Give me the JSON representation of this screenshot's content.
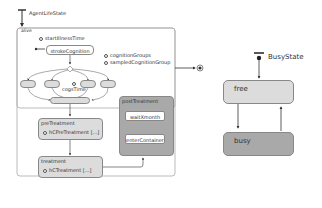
{
  "left_chart": {
    "entry_label": "AgentLifeState",
    "container_label": "alive",
    "events": [
      "startIllnessTime",
      "cognitionGroups",
      "sampledCognitionGroup",
      "cogsTime"
    ],
    "states": {
      "stroke": "strokeCognition",
      "preTreatment": {
        "title": "preTreatment",
        "action": "hCPreTreatment [...]"
      },
      "treatment": {
        "title": "treatment",
        "action": "hCTreatment [...]"
      },
      "postTreatment": {
        "title": "postTreatment",
        "sub1": "waitXmonth",
        "sub2": "enterContainer"
      }
    }
  },
  "right_chart": {
    "entry_label": "BusyState",
    "states": {
      "free": "free",
      "busy": "busy"
    },
    "colors": {
      "free": "#dcdcdc",
      "busy": "#a9a9a9"
    }
  }
}
